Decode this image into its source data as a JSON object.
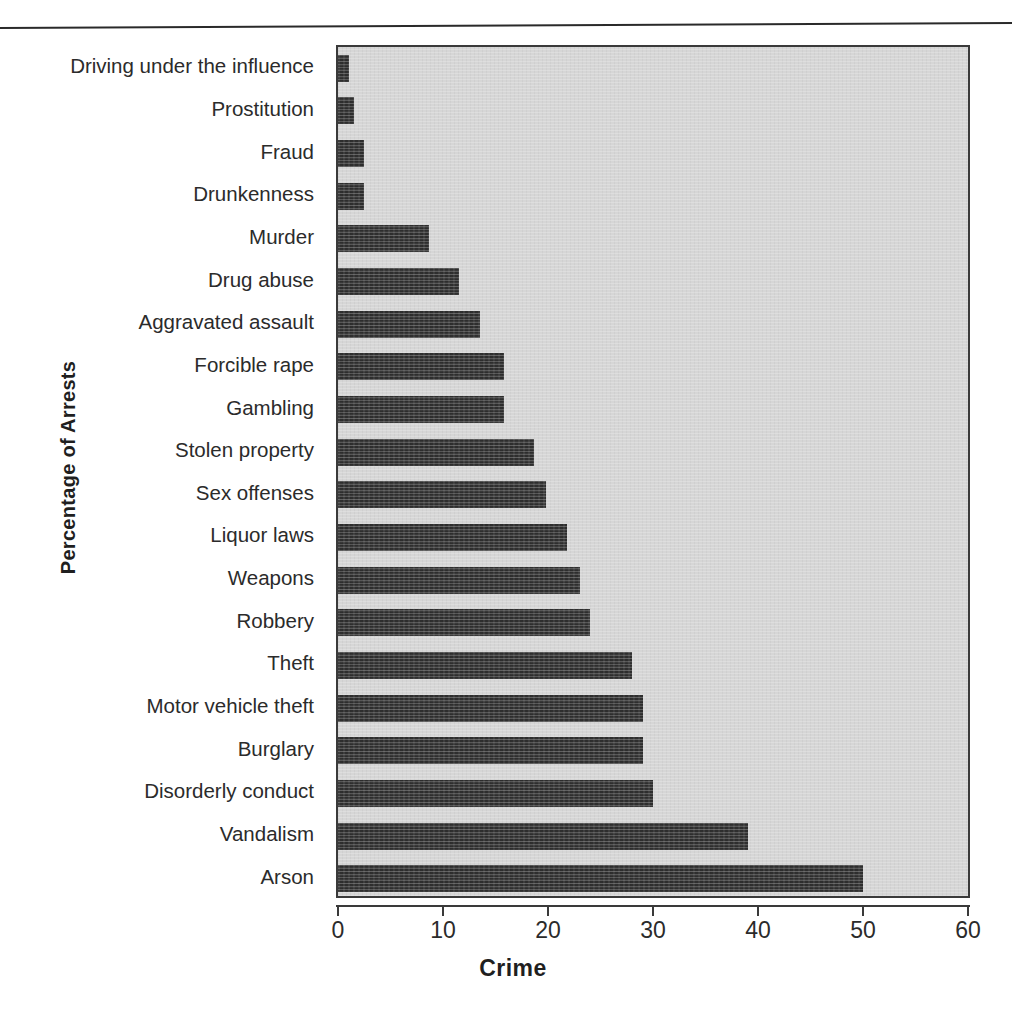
{
  "figure": {
    "top_rule": "horizontal-rule",
    "panel_color": "#d6d6d6",
    "bar_color": "#2e2e2e",
    "axis_color": "#3a3a3a"
  },
  "chart_data": {
    "type": "bar",
    "orientation": "horizontal",
    "title": "",
    "xlabel": "Crime",
    "ylabel": "Percentage of Arrests",
    "xlim": [
      0,
      60
    ],
    "xticks": [
      0,
      10,
      20,
      30,
      40,
      50,
      60
    ],
    "xtick_labels": [
      "0",
      "10",
      "20",
      "30",
      "40",
      "50",
      "60"
    ],
    "grid": false,
    "legend": "none",
    "categories": [
      "Driving under the influence",
      "Prostitution",
      "Fraud",
      "Drunkenness",
      "Murder",
      "Drug abuse",
      "Aggravated assault",
      "Forcible rape",
      "Gambling",
      "Stolen property",
      "Sex offenses",
      "Liquor laws",
      "Weapons",
      "Robbery",
      "Theft",
      "Motor vehicle theft",
      "Burglary",
      "Disorderly conduct",
      "Vandalism",
      "Arson"
    ],
    "values": [
      1,
      1.5,
      2.5,
      2.5,
      8.7,
      11.5,
      13.5,
      15.8,
      15.8,
      18.7,
      19.8,
      21.8,
      23,
      24,
      28,
      29,
      29,
      30,
      39,
      50
    ]
  }
}
